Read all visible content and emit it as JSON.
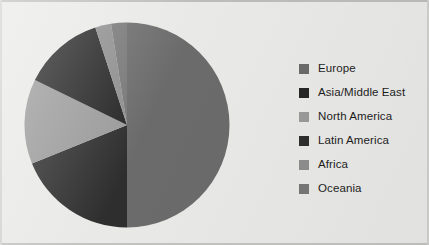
{
  "chart_data": {
    "type": "pie",
    "title": "",
    "subtitle": "",
    "xlabel": "",
    "ylabel": "",
    "legend_position": "right",
    "grid": false,
    "start_angle_deg": 0,
    "direction": "clockwise",
    "categories": [
      "Europe",
      "Asia/Middle East",
      "North America",
      "Latin America",
      "Africa",
      "Oceania"
    ],
    "values": [
      50.0,
      12.8,
      13.3,
      18.9,
      2.5,
      2.5
    ],
    "colors": [
      "#6b6b6b",
      "#262626",
      "#9a9a9a",
      "#2e2e2e",
      "#8e8e8e",
      "#777777"
    ],
    "slices": [
      {
        "label": "Europe",
        "value": 50.0,
        "color": "#6b6b6b",
        "start_deg": 0.0,
        "end_deg": 180.0
      },
      {
        "label": "Latin America",
        "value": 18.9,
        "color": "#2e2e2e",
        "start_deg": 180.0,
        "end_deg": 248.0
      },
      {
        "label": "North America",
        "value": 13.3,
        "color": "#9a9a9a",
        "start_deg": 248.0,
        "end_deg": 296.0
      },
      {
        "label": "Asia/Middle East",
        "value": 12.8,
        "color": "#262626",
        "start_deg": 296.0,
        "end_deg": 342.0
      },
      {
        "label": "Africa",
        "value": 2.5,
        "color": "#8e8e8e",
        "start_deg": 342.0,
        "end_deg": 351.0
      },
      {
        "label": "Oceania",
        "value": 2.5,
        "color": "#777777",
        "start_deg": 351.0,
        "end_deg": 360.0
      }
    ]
  },
  "legend": {
    "items": [
      {
        "label": "Europe",
        "color": "#6b6b6b"
      },
      {
        "label": "Asia/Middle East",
        "color": "#262626"
      },
      {
        "label": "North America",
        "color": "#9a9a9a"
      },
      {
        "label": "Latin America",
        "color": "#2e2e2e"
      },
      {
        "label": "Africa",
        "color": "#8e8e8e"
      },
      {
        "label": "Oceania",
        "color": "#777777"
      }
    ]
  },
  "figure": {
    "background": "#e9e9e7",
    "border_color": "#bcbcb9"
  }
}
